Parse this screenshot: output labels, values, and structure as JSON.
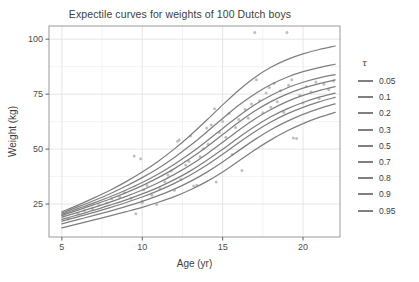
{
  "chart_data": {
    "type": "line",
    "title": "Expectile curves for weights of 100 Dutch boys",
    "xlabel": "Age (yr)",
    "ylabel": "Weight (kg)",
    "xlim": [
      4.2,
      22.3
    ],
    "ylim": [
      10,
      106
    ],
    "xticks": [
      5,
      10,
      15,
      20
    ],
    "xticklabels": [
      "5",
      "10",
      "15",
      "20"
    ],
    "yticks": [
      25,
      50,
      75,
      100
    ],
    "yticklabels": [
      "25",
      "50",
      "75",
      "100"
    ],
    "grid": true,
    "grid_minor": true,
    "legend_title": "τ",
    "legend_position": "right",
    "line_color": "#7f7f7f",
    "point_color": "#bfbfbf",
    "panel_background": "#ffffff",
    "panel_border_color": "#9a9a9a",
    "grid_color": "#ebebeb",
    "x": [
      5,
      6,
      7,
      8,
      9,
      10,
      11,
      12,
      13,
      14,
      15,
      16,
      17,
      18,
      19,
      20,
      21,
      22
    ],
    "series": [
      {
        "name": "0.05",
        "tau": 0.05,
        "values": [
          14.2,
          16.0,
          17.8,
          19.6,
          21.5,
          23.5,
          25.8,
          28.4,
          31.5,
          35.2,
          39.6,
          44.6,
          49.6,
          54.2,
          58.2,
          61.6,
          64.4,
          66.7
        ]
      },
      {
        "name": "0.1",
        "tau": 0.1,
        "values": [
          16.0,
          17.9,
          19.8,
          21.8,
          23.9,
          26.2,
          28.8,
          31.8,
          35.3,
          39.4,
          44.1,
          49.3,
          54.3,
          58.8,
          62.6,
          65.8,
          68.4,
          70.6
        ]
      },
      {
        "name": "0.2",
        "tau": 0.2,
        "values": [
          17.2,
          19.2,
          21.2,
          23.4,
          25.7,
          28.2,
          31.1,
          34.4,
          38.2,
          42.6,
          47.6,
          52.9,
          57.9,
          62.3,
          66.0,
          69.0,
          71.5,
          73.5
        ]
      },
      {
        "name": "0.3",
        "tau": 0.3,
        "values": [
          18.0,
          20.1,
          22.2,
          24.5,
          26.9,
          29.6,
          32.6,
          36.1,
          40.1,
          44.8,
          49.9,
          55.3,
          60.3,
          64.7,
          68.3,
          71.2,
          73.6,
          75.5
        ]
      },
      {
        "name": "0.5",
        "tau": 0.5,
        "values": [
          19.0,
          21.2,
          23.5,
          25.9,
          28.5,
          31.4,
          34.7,
          38.5,
          42.8,
          47.7,
          53.1,
          58.6,
          63.7,
          68.0,
          71.6,
          74.4,
          76.6,
          78.4
        ]
      },
      {
        "name": "0.7",
        "tau": 0.7,
        "values": [
          19.8,
          22.2,
          24.7,
          27.3,
          30.2,
          33.4,
          37.0,
          41.1,
          45.8,
          51.0,
          56.6,
          62.2,
          67.3,
          71.6,
          75.0,
          77.7,
          79.8,
          81.5
        ]
      },
      {
        "name": "0.8",
        "tau": 0.8,
        "values": [
          20.3,
          22.9,
          25.5,
          28.3,
          31.4,
          34.8,
          38.7,
          43.1,
          48.1,
          53.6,
          59.4,
          65.1,
          70.2,
          74.4,
          77.8,
          80.4,
          82.4,
          83.9
        ]
      },
      {
        "name": "0.9",
        "tau": 0.9,
        "values": [
          20.9,
          23.7,
          26.6,
          29.7,
          33.2,
          37.0,
          41.3,
          46.2,
          51.7,
          57.7,
          63.9,
          69.9,
          75.1,
          79.4,
          82.7,
          85.2,
          87.1,
          88.6
        ]
      },
      {
        "name": "0.95",
        "tau": 0.95,
        "values": [
          21.5,
          24.5,
          27.8,
          31.3,
          35.2,
          39.6,
          44.5,
          50.1,
          56.3,
          63.1,
          70.1,
          76.8,
          82.6,
          87.2,
          90.7,
          93.3,
          95.3,
          96.9
        ]
      }
    ],
    "scatter": [
      [
        5.1,
        19.5
      ],
      [
        5.4,
        18.2
      ],
      [
        6.0,
        20.8
      ],
      [
        6.4,
        22.1
      ],
      [
        6.9,
        23.0
      ],
      [
        7.3,
        24.8
      ],
      [
        7.8,
        25.5
      ],
      [
        8.1,
        27.4
      ],
      [
        8.6,
        28.2
      ],
      [
        8.9,
        30.1
      ],
      [
        9.3,
        27.6
      ],
      [
        9.5,
        46.8
      ],
      [
        9.6,
        20.6
      ],
      [
        9.9,
        45.6
      ],
      [
        10.0,
        25.6
      ],
      [
        10.0,
        26.3
      ],
      [
        10.1,
        31.5
      ],
      [
        10.3,
        33.4
      ],
      [
        10.6,
        29.0
      ],
      [
        10.9,
        24.8
      ],
      [
        11.1,
        32.0
      ],
      [
        11.4,
        35.1
      ],
      [
        11.6,
        38.2
      ],
      [
        11.8,
        40.0
      ],
      [
        12.0,
        31.3
      ],
      [
        12.2,
        53.6
      ],
      [
        12.3,
        54.1
      ],
      [
        12.4,
        36.2
      ],
      [
        12.7,
        42.8
      ],
      [
        12.9,
        44.5
      ],
      [
        13.0,
        56.0
      ],
      [
        13.2,
        33.2
      ],
      [
        13.4,
        33.5
      ],
      [
        13.6,
        46.5
      ],
      [
        13.8,
        50.1
      ],
      [
        14.0,
        59.6
      ],
      [
        14.1,
        52.2
      ],
      [
        14.3,
        61.0
      ],
      [
        14.5,
        68.4
      ],
      [
        14.6,
        35.0
      ],
      [
        14.8,
        57.5
      ],
      [
        15.0,
        62.5
      ],
      [
        15.2,
        55.4
      ],
      [
        15.4,
        66.2
      ],
      [
        15.6,
        47.5
      ],
      [
        15.8,
        59.8
      ],
      [
        16.0,
        63.5
      ],
      [
        16.2,
        40.2
      ],
      [
        16.4,
        68.0
      ],
      [
        16.6,
        64.0
      ],
      [
        16.8,
        70.5
      ],
      [
        17.0,
        103.0
      ],
      [
        17.1,
        81.5
      ],
      [
        17.3,
        72.0
      ],
      [
        17.5,
        66.5
      ],
      [
        17.7,
        75.5
      ],
      [
        17.9,
        78.0
      ],
      [
        18.0,
        69.0
      ],
      [
        18.2,
        80.0
      ],
      [
        18.4,
        71.5
      ],
      [
        18.6,
        76.5
      ],
      [
        18.8,
        66.8
      ],
      [
        19.0,
        103.0
      ],
      [
        19.1,
        79.0
      ],
      [
        19.3,
        81.5
      ],
      [
        19.4,
        55.0
      ],
      [
        19.6,
        54.8
      ],
      [
        19.8,
        74.5
      ],
      [
        20.0,
        71.0
      ],
      [
        20.2,
        78.5
      ],
      [
        20.5,
        76.0
      ],
      [
        20.8,
        80.5
      ],
      [
        21.0,
        73.0
      ],
      [
        21.3,
        79.5
      ],
      [
        21.6,
        77.0
      ],
      [
        21.9,
        81.0
      ]
    ]
  }
}
